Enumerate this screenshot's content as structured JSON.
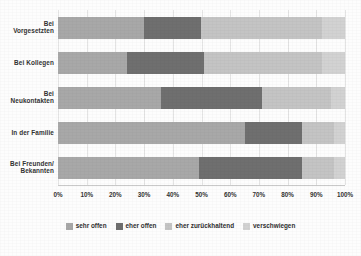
{
  "chart_data": {
    "type": "bar",
    "orientation": "horizontal",
    "stacked": true,
    "normalized_percent": true,
    "title": "",
    "subtitle": "",
    "xlabel": "",
    "ylabel": "",
    "xlim": [
      0,
      100
    ],
    "grid": true,
    "legend_position": "bottom",
    "categories": [
      "Bei Vorgesetzten",
      "Bei Kollegen",
      "Bei Neukontakten",
      "In der Familie",
      "Bei Freunden/ Bekannten"
    ],
    "category_lines": [
      [
        "Bei",
        "Vorgesetzten"
      ],
      [
        "Bei Kollegen"
      ],
      [
        "Bei",
        "Neukontakten"
      ],
      [
        "In der Familie"
      ],
      [
        "Bei Freunden/",
        "Bekannten"
      ]
    ],
    "tick_labels": [
      "0%",
      "10%",
      "20%",
      "30%",
      "40%",
      "50%",
      "60%",
      "70%",
      "80%",
      "90%",
      "100%"
    ],
    "tick_values": [
      0,
      10,
      20,
      30,
      40,
      50,
      60,
      70,
      80,
      90,
      100
    ],
    "series": [
      {
        "name": "sehr offen",
        "color": "#a8a8a8",
        "values": [
          30,
          24,
          36,
          65,
          49
        ]
      },
      {
        "name": "eher offen",
        "color": "#6f6f6f",
        "values": [
          20,
          27,
          35,
          20,
          36
        ]
      },
      {
        "name": "eher zurückhaltend",
        "color": "#c4c4c4",
        "values": [
          42,
          41,
          24,
          11,
          11
        ]
      },
      {
        "name": "verschwiegen",
        "color": "#d2d2d2",
        "values": [
          8,
          8,
          5,
          4,
          4
        ]
      }
    ]
  },
  "legend": {
    "items": [
      {
        "label": "sehr offen",
        "color": "#a8a8a8"
      },
      {
        "label": "eher offen",
        "color": "#6f6f6f"
      },
      {
        "label": "eher zurückhaltend",
        "color": "#c4c4c4"
      },
      {
        "label": "verschwiegen",
        "color": "#d2d2d2"
      }
    ]
  }
}
